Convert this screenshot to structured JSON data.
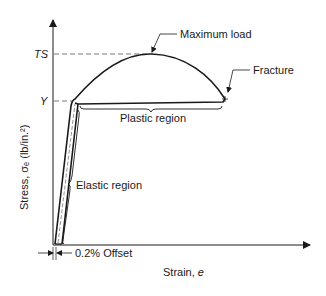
{
  "diagram": {
    "type": "stress-strain curve",
    "axes": {
      "y_label": "Stress, σₑ (lb/in.²)",
      "x_label_prefix": "Strain, ",
      "x_label_var": "e"
    },
    "levels": {
      "tensile_strength": "TS",
      "yield": "Y"
    },
    "annotations": {
      "maximum_load": "Maximum load",
      "fracture": "Fracture",
      "plastic_region": "Plastic region",
      "elastic_region": "Elastic region",
      "offset": "0.2% Offset"
    },
    "colors": {
      "line": "#1a1a1a",
      "dashed": "#555555",
      "background": "#ffffff"
    }
  }
}
